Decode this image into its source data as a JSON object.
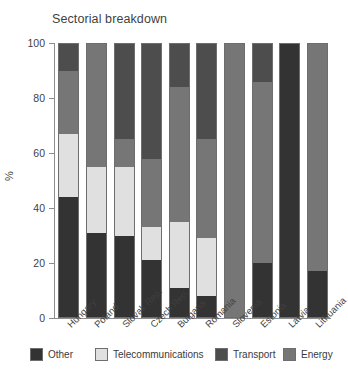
{
  "chart_data": {
    "type": "bar",
    "subtype": "stacked-bar-vertical",
    "title": "Sectorial breakdown",
    "xlabel": "",
    "ylabel": "%",
    "ylim": [
      0,
      100
    ],
    "yticks": [
      0,
      20,
      40,
      60,
      80,
      100
    ],
    "ytick_labels": [
      "0",
      "20",
      "40",
      "60",
      "80",
      "100"
    ],
    "grid": false,
    "legend_position": "bottom",
    "stack_order": [
      "Other",
      "Telecommunications",
      "Energy",
      "Transport"
    ],
    "categories": [
      "Hungary",
      "Poland",
      "Slovak Rep.",
      "Czech Rep.",
      "Bulgaria",
      "Romania",
      "Slovenia",
      "Estonia",
      "Latvia",
      "Lithuania"
    ],
    "series": [
      {
        "name": "Other",
        "color": "#333333",
        "values": [
          44,
          31,
          30,
          21,
          11,
          8,
          0,
          20,
          100,
          17
        ]
      },
      {
        "name": "Telecommunications",
        "color": "#e0e0e0",
        "values": [
          23,
          24,
          25,
          12,
          24,
          21,
          0,
          0,
          0,
          0
        ]
      },
      {
        "name": "Energy",
        "color": "#767676",
        "values": [
          23,
          45,
          10,
          25,
          49,
          36,
          100,
          66,
          0,
          83
        ]
      },
      {
        "name": "Transport",
        "color": "#4d4d4d",
        "values": [
          10,
          0,
          35,
          42,
          16,
          35,
          0,
          14,
          0,
          0
        ]
      }
    ]
  },
  "legend": {
    "items": [
      {
        "label": "Other",
        "color": "#333333"
      },
      {
        "label": "Telecommunications",
        "color": "#e0e0e0"
      },
      {
        "label": "Transport",
        "color": "#4d4d4d"
      },
      {
        "label": "Energy",
        "color": "#767676"
      }
    ]
  },
  "colors": {
    "axis": "#8d8d8d",
    "text": "#3f3f3f",
    "background": "#ffffff",
    "bar_border": "#6e6e6e"
  }
}
